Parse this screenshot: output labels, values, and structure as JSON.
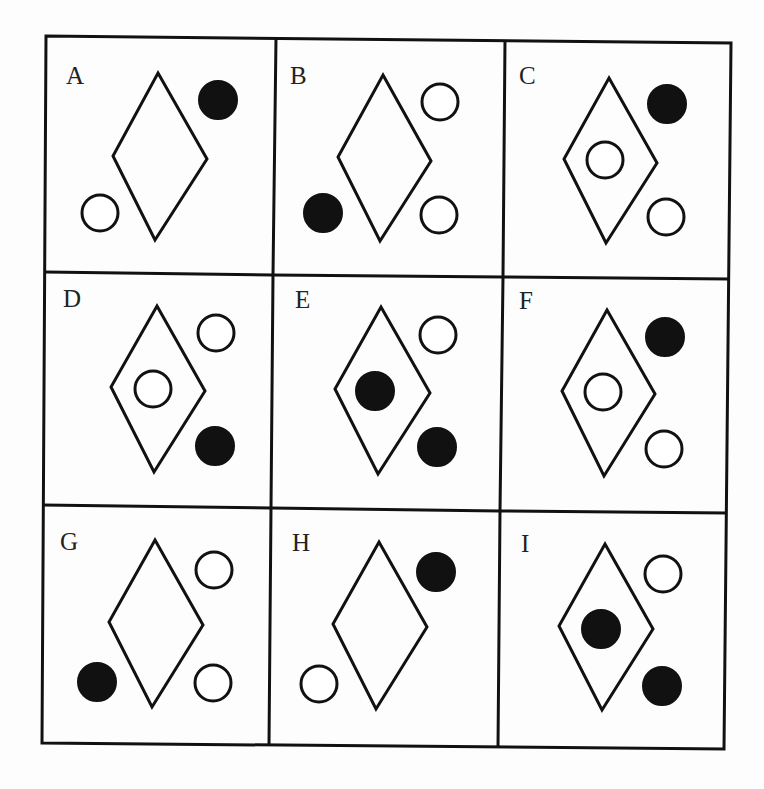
{
  "puzzle": {
    "type": "3x3 visual pattern matrix",
    "colors": {
      "line": "#111111",
      "filled_circle": "#111111",
      "hollow_circle_fill": "#ffffff",
      "background": "#fdfdfd"
    },
    "grid": {
      "rows": 3,
      "cols": 3,
      "corners": {
        "top_left": [
          46,
          36
        ],
        "top_right": [
          731,
          43
        ],
        "bottom_left": [
          42,
          743
        ],
        "bottom_right": [
          724,
          749
        ]
      }
    },
    "cells": [
      {
        "label": "A",
        "label_pos": [
          66,
          84
        ],
        "diamond": [
          [
            158,
            73
          ],
          [
            207,
            159
          ],
          [
            155,
            240
          ],
          [
            113,
            156
          ]
        ],
        "circles": [
          {
            "position": "top-right",
            "cx": 218,
            "cy": 100,
            "r": 19,
            "fill": "filled"
          },
          {
            "position": "bottom-left",
            "cx": 100,
            "cy": 213,
            "r": 18,
            "fill": "hollow"
          }
        ]
      },
      {
        "label": "B",
        "label_pos": [
          290,
          84
        ],
        "diamond": [
          [
            383,
            75
          ],
          [
            431,
            161
          ],
          [
            380,
            241
          ],
          [
            338,
            157
          ]
        ],
        "circles": [
          {
            "position": "top-right",
            "cx": 440,
            "cy": 102,
            "r": 18,
            "fill": "hollow"
          },
          {
            "position": "bottom-left",
            "cx": 323,
            "cy": 213,
            "r": 19,
            "fill": "filled"
          },
          {
            "position": "bottom-right",
            "cx": 439,
            "cy": 215,
            "r": 18,
            "fill": "hollow"
          }
        ]
      },
      {
        "label": "C",
        "label_pos": [
          519,
          84
        ],
        "diamond": [
          [
            609,
            78
          ],
          [
            657,
            163
          ],
          [
            606,
            243
          ],
          [
            564,
            159
          ]
        ],
        "circles": [
          {
            "position": "inside-diamond",
            "cx": 605,
            "cy": 160,
            "r": 18,
            "fill": "hollow"
          },
          {
            "position": "top-right",
            "cx": 667,
            "cy": 104,
            "r": 19,
            "fill": "filled"
          },
          {
            "position": "bottom-right",
            "cx": 666,
            "cy": 217,
            "r": 18,
            "fill": "hollow"
          }
        ]
      },
      {
        "label": "D",
        "label_pos": [
          63,
          307
        ],
        "diamond": [
          [
            157,
            306
          ],
          [
            205,
            391
          ],
          [
            154,
            472
          ],
          [
            111,
            387
          ]
        ],
        "circles": [
          {
            "position": "inside-diamond",
            "cx": 153,
            "cy": 389,
            "r": 18,
            "fill": "hollow"
          },
          {
            "position": "top-right",
            "cx": 216,
            "cy": 333,
            "r": 18,
            "fill": "hollow"
          },
          {
            "position": "bottom-right",
            "cx": 215,
            "cy": 446,
            "r": 19,
            "fill": "filled"
          }
        ]
      },
      {
        "label": "E",
        "label_pos": [
          295,
          308
        ],
        "diamond": [
          [
            381,
            307
          ],
          [
            430,
            393
          ],
          [
            378,
            474
          ],
          [
            335,
            389
          ]
        ],
        "circles": [
          {
            "position": "inside-diamond",
            "cx": 375,
            "cy": 391,
            "r": 19,
            "fill": "filled"
          },
          {
            "position": "top-right",
            "cx": 438,
            "cy": 335,
            "r": 18,
            "fill": "hollow"
          },
          {
            "position": "bottom-right",
            "cx": 437,
            "cy": 447,
            "r": 19,
            "fill": "filled"
          }
        ]
      },
      {
        "label": "F",
        "label_pos": [
          519,
          309
        ],
        "diamond": [
          [
            607,
            310
          ],
          [
            655,
            394
          ],
          [
            604,
            476
          ],
          [
            562,
            391
          ]
        ],
        "circles": [
          {
            "position": "inside-diamond",
            "cx": 603,
            "cy": 392,
            "r": 18,
            "fill": "hollow"
          },
          {
            "position": "top-right",
            "cx": 665,
            "cy": 337,
            "r": 19,
            "fill": "filled"
          },
          {
            "position": "bottom-right",
            "cx": 664,
            "cy": 449,
            "r": 18,
            "fill": "hollow"
          }
        ]
      },
      {
        "label": "G",
        "label_pos": [
          60,
          550
        ],
        "diamond": [
          [
            155,
            540
          ],
          [
            203,
            625
          ],
          [
            152,
            707
          ],
          [
            109,
            622
          ]
        ],
        "circles": [
          {
            "position": "top-right",
            "cx": 214,
            "cy": 570,
            "r": 18,
            "fill": "hollow"
          },
          {
            "position": "bottom-left",
            "cx": 97,
            "cy": 682,
            "r": 19,
            "fill": "filled"
          },
          {
            "position": "bottom-right",
            "cx": 213,
            "cy": 683,
            "r": 18,
            "fill": "hollow"
          }
        ]
      },
      {
        "label": "H",
        "label_pos": [
          292,
          551
        ],
        "diamond": [
          [
            379,
            542
          ],
          [
            427,
            627
          ],
          [
            376,
            709
          ],
          [
            333,
            624
          ]
        ],
        "circles": [
          {
            "position": "top-right",
            "cx": 436,
            "cy": 572,
            "r": 19,
            "fill": "filled"
          },
          {
            "position": "bottom-left",
            "cx": 319,
            "cy": 684,
            "r": 18,
            "fill": "hollow"
          }
        ]
      },
      {
        "label": "I",
        "label_pos": [
          521,
          552
        ],
        "diamond": [
          [
            605,
            544
          ],
          [
            653,
            629
          ],
          [
            602,
            710
          ],
          [
            559,
            626
          ]
        ],
        "circles": [
          {
            "position": "inside-diamond",
            "cx": 601,
            "cy": 629,
            "r": 19,
            "fill": "filled"
          },
          {
            "position": "top-right",
            "cx": 663,
            "cy": 574,
            "r": 18,
            "fill": "hollow"
          },
          {
            "position": "bottom-right",
            "cx": 662,
            "cy": 686,
            "r": 19,
            "fill": "filled"
          }
        ]
      }
    ]
  }
}
